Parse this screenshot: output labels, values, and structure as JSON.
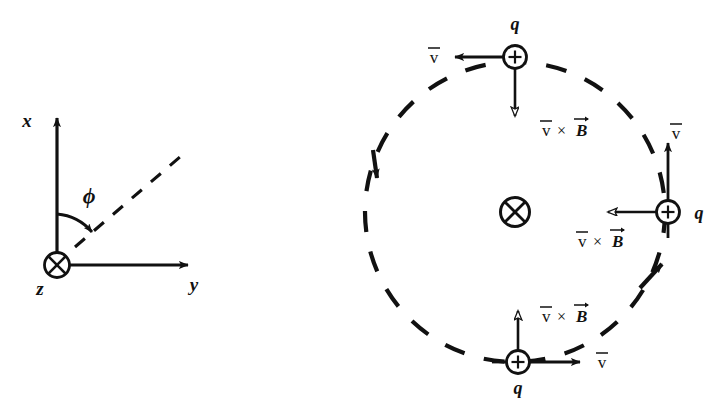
{
  "figure": {
    "stroke_color": "#111111",
    "background_color": "#ffffff",
    "panels": [
      {
        "id": "coordinate-axes",
        "name": "left-coordinate-system"
      },
      {
        "id": "circular-motion",
        "name": "right-circular-orbit"
      }
    ]
  },
  "axes": {
    "x_label": "x",
    "y_label": "y",
    "z_label": "z",
    "angle_label": "ϕ",
    "origin_symbol": "circle-cross",
    "origin_meaning": "z-axis out-of-page crossed (into page)",
    "dashed_ray_label": "",
    "origin_px": {
      "x": 57,
      "y": 265
    },
    "x_tip_px": {
      "x": 57,
      "y": 112
    },
    "y_tip_px": {
      "x": 200,
      "y": 265
    }
  },
  "orbit": {
    "center_px": {
      "x": 515,
      "y": 212
    },
    "radius_px": 150,
    "path_style": "dashed",
    "sense": "clockwise",
    "field_symbol": "circle-cross",
    "field_meaning": "B into page",
    "direction_arrow_count": 2
  },
  "charges": [
    {
      "id": "charge-top",
      "position": "top",
      "charge_label": "q",
      "sign_glyph": "+",
      "velocity_label": "v̄",
      "velocity_direction": "left",
      "force_label": "v̄ × B⃗",
      "force_direction": "down",
      "force_arrowhead": "hollow",
      "center_px": {
        "x": 515,
        "y": 57
      }
    },
    {
      "id": "charge-right",
      "position": "right",
      "charge_label": "q",
      "sign_glyph": "+",
      "velocity_label": "v̄",
      "velocity_direction": "up",
      "force_label": "v̄ × B⃗",
      "force_direction": "left",
      "force_arrowhead": "hollow",
      "center_px": {
        "x": 668,
        "y": 212
      }
    },
    {
      "id": "charge-bottom",
      "position": "bottom",
      "charge_label": "q",
      "sign_glyph": "+",
      "velocity_label": "v̄",
      "velocity_direction": "right",
      "force_label": "v̄ × B⃗",
      "force_direction": "up",
      "force_arrowhead": "hollow",
      "center_px": {
        "x": 518,
        "y": 362
      }
    }
  ],
  "symbols": {
    "v_glyph": "v",
    "B_glyph": "B",
    "times_glyph": "×",
    "plus_glyph": "+"
  }
}
